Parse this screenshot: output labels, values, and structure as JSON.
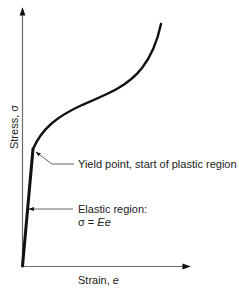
{
  "diagram": {
    "type": "stress-strain curve",
    "axes": {
      "y_label_text": "Stress, ",
      "y_label_symbol": "σ",
      "x_label_text": "Strain, ",
      "x_label_symbol": "e"
    },
    "annotations": {
      "yield": "Yield point, start of plastic region",
      "elastic_title": "Elastic region:",
      "elastic_formula_lhs": "σ = ",
      "elastic_formula_rhs": "Ee"
    },
    "colors": {
      "curve": "#111111",
      "axis": "#6a6a6a",
      "leader": "#555555",
      "text": "#222222"
    }
  }
}
